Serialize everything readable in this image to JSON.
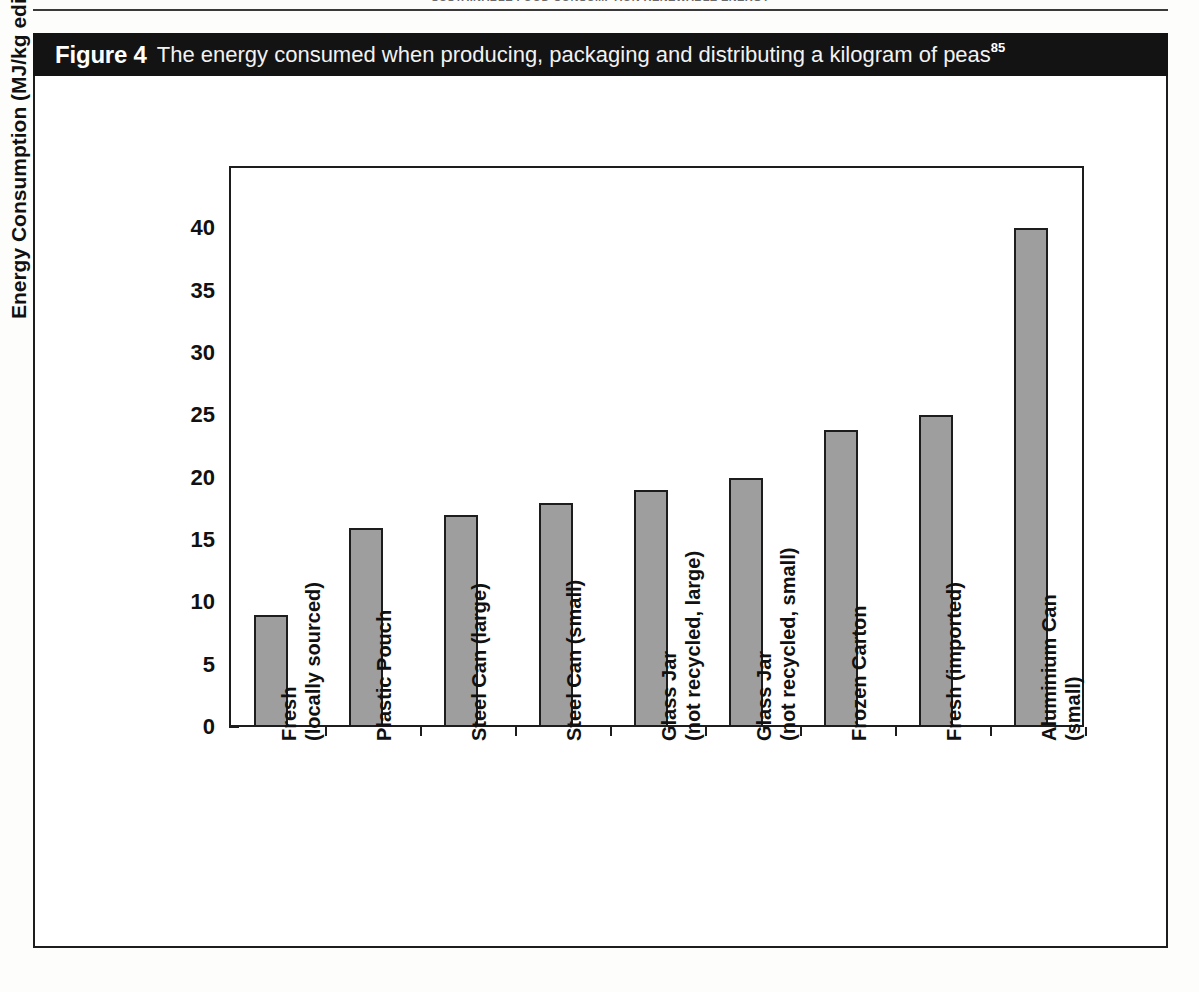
{
  "running_header": {
    "text": "SUSTAINABLE FOOD CONSUMPTION RENEWABLE ENERGY"
  },
  "figure": {
    "number_label": "Figure 4",
    "caption": "The energy consumed when producing, packaging and distributing a kilogram of peas",
    "reference_superscript": "85"
  },
  "colors": {
    "caption_bar_bg": "#131313",
    "caption_text": "#ffffff",
    "bar_fill": "#9e9e9e",
    "bar_stroke": "#1d1d1d",
    "axis": "#1d1d1d",
    "page_bg": "#ffffff"
  },
  "chart_data": {
    "type": "bar",
    "title": "The energy consumed when producing, packaging and distributing a kilogram of peas",
    "xlabel": "",
    "ylabel": "Energy Consumption (MJ/kg edible product)",
    "ylim": [
      0,
      45
    ],
    "yticks": [
      0,
      5,
      10,
      15,
      20,
      25,
      30,
      35,
      40
    ],
    "ytick_labels": [
      "0",
      "5",
      "10",
      "15",
      "20",
      "25",
      "30",
      "35",
      "40"
    ],
    "grid": false,
    "legend": false,
    "categories": [
      "Fresh (locally sourced)",
      "Plastic Pouch",
      "Steel Can (large)",
      "Steel Can (small)",
      "Glass Jar (not recycled, large)",
      "Glass Jar (not recycled, small)",
      "Frozen Carton",
      "Fresh (imported)",
      "Aluminium Can (small)"
    ],
    "category_lines": [
      [
        "Fresh",
        "(locally sourced)"
      ],
      [
        "Plastic Pouch",
        ""
      ],
      [
        "Steel Can (large)",
        ""
      ],
      [
        "Steel Can (small)",
        ""
      ],
      [
        "Glass Jar",
        "(not recycled, large)"
      ],
      [
        "Glass Jar",
        "(not recycled, small)"
      ],
      [
        "Frozen Carton",
        ""
      ],
      [
        "Fresh (imported)",
        ""
      ],
      [
        "Aluminium Can",
        "(small)"
      ]
    ],
    "values": [
      9,
      16,
      17,
      18,
      19,
      20,
      23.8,
      25,
      40
    ],
    "units": "MJ/kg edible product"
  }
}
